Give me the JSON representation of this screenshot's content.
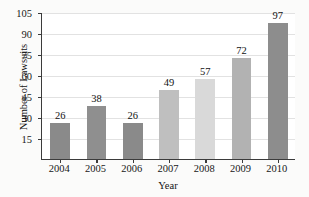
{
  "chart_data": {
    "type": "bar",
    "title": "",
    "xlabel": "Year",
    "ylabel": "Number of Lawsuits",
    "categories": [
      "2004",
      "2005",
      "2006",
      "2007",
      "2008",
      "2009",
      "2010"
    ],
    "values": [
      26,
      38,
      26,
      49,
      57,
      72,
      97
    ],
    "data_labels": [
      "26",
      "38",
      "26",
      "49",
      "57",
      "72",
      "97"
    ],
    "ylim": [
      0,
      105
    ],
    "ytick_labels": [
      "15",
      "30",
      "45",
      "60",
      "75",
      "90",
      "105"
    ],
    "ytick_values": [
      15,
      30,
      45,
      60,
      75,
      90,
      105
    ],
    "grid": "horizontal",
    "legend": "none",
    "bar_colors": [
      "#8a8a8a",
      "#8f8f8f",
      "#8a8a8a",
      "#bfbfbf",
      "#d9d9d9",
      "#b2b2b2",
      "#8d8d8d"
    ],
    "axis_color": "#3b3b3b",
    "gridline_color": "#e2e2e2",
    "plot_background": "#ffffff",
    "page_background": "#fbfbfa"
  }
}
